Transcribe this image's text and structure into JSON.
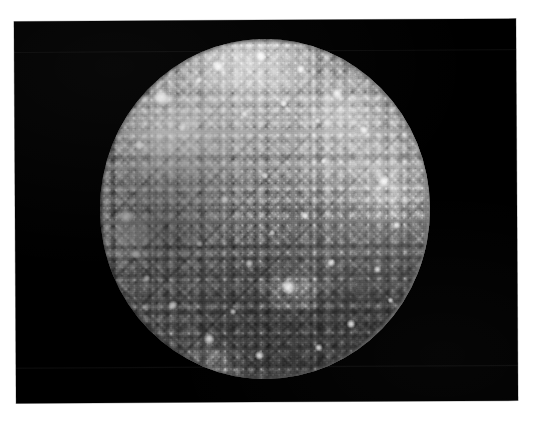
{
  "image": {
    "domain": "Natural-Image",
    "subject": "Callisto",
    "subject_type": "moon",
    "description": "Grayscale spacecraft photograph of a heavily cratered icy moon disk centered on a black sky background",
    "orientation": "landscape",
    "is_color": false,
    "alt_text": "A full disk of a heavily cratered grey moon against black space, densely covered with bright impact craters"
  },
  "frame": {
    "page_background_color": "#ffffff",
    "plate_background_color": "#000000",
    "plate_border_color": "#b8b8b8",
    "plate_rotation_degrees": -0.32,
    "plate_left": 15,
    "plate_top": 20,
    "plate_width": 502,
    "plate_height": 382
  },
  "disk": {
    "label": "moon-disk",
    "center_x": 250,
    "center_y": 189,
    "radius_x": 165,
    "radius_y": 170,
    "base_color": "#8e8e8e",
    "highlight_color": "#e8e8e8",
    "shadow_color": "#2a2a2a",
    "limb_bright_side": "east",
    "limb_dark_side": "west",
    "brightest_quadrant": "north-west",
    "darkest_quadrant": "south-east",
    "surface_texture": "dense overlapping impact craters with bright ejecta rays"
  },
  "bright_craters": [
    {
      "name": "crater-nw-large",
      "x": 19,
      "y": 17,
      "size": 17,
      "intensity": 0.95
    },
    {
      "name": "crater-n-1",
      "x": 36,
      "y": 8,
      "size": 12,
      "intensity": 0.92
    },
    {
      "name": "crater-n-2",
      "x": 49,
      "y": 5,
      "size": 10,
      "intensity": 0.9
    },
    {
      "name": "crater-n-3",
      "x": 61,
      "y": 9,
      "size": 9,
      "intensity": 0.88
    },
    {
      "name": "crater-ne-1",
      "x": 72,
      "y": 16,
      "size": 11,
      "intensity": 0.9
    },
    {
      "name": "crater-ne-2",
      "x": 80,
      "y": 27,
      "size": 9,
      "intensity": 0.86
    },
    {
      "name": "crater-nw-2",
      "x": 12,
      "y": 31,
      "size": 9,
      "intensity": 0.84
    },
    {
      "name": "crater-nw-3",
      "x": 25,
      "y": 26,
      "size": 8,
      "intensity": 0.82
    },
    {
      "name": "crater-c-1",
      "x": 44,
      "y": 22,
      "size": 8,
      "intensity": 0.84
    },
    {
      "name": "crater-c-2",
      "x": 56,
      "y": 19,
      "size": 7,
      "intensity": 0.8
    },
    {
      "name": "crater-e-1",
      "x": 86,
      "y": 42,
      "size": 12,
      "intensity": 0.94
    },
    {
      "name": "crater-e-2",
      "x": 90,
      "y": 55,
      "size": 8,
      "intensity": 0.82
    },
    {
      "name": "crater-w-1",
      "x": 8,
      "y": 52,
      "size": 13,
      "intensity": 0.9
    },
    {
      "name": "crater-w-2",
      "x": 11,
      "y": 63,
      "size": 9,
      "intensity": 0.84
    },
    {
      "name": "crater-c-3",
      "x": 38,
      "y": 47,
      "size": 8,
      "intensity": 0.82
    },
    {
      "name": "crater-c-4",
      "x": 50,
      "y": 40,
      "size": 7,
      "intensity": 0.8
    },
    {
      "name": "crater-c-5",
      "x": 62,
      "y": 52,
      "size": 8,
      "intensity": 0.82
    },
    {
      "name": "crater-c-6",
      "x": 30,
      "y": 60,
      "size": 7,
      "intensity": 0.78
    },
    {
      "name": "crater-s-1",
      "x": 57,
      "y": 73,
      "size": 14,
      "intensity": 0.96
    },
    {
      "name": "crater-s-2",
      "x": 45,
      "y": 66,
      "size": 8,
      "intensity": 0.8
    },
    {
      "name": "crater-s-3",
      "x": 70,
      "y": 66,
      "size": 8,
      "intensity": 0.8
    },
    {
      "name": "crater-sw-1",
      "x": 22,
      "y": 78,
      "size": 9,
      "intensity": 0.84
    },
    {
      "name": "crater-sw-2",
      "x": 33,
      "y": 88,
      "size": 11,
      "intensity": 0.88
    },
    {
      "name": "crater-s-4",
      "x": 48,
      "y": 93,
      "size": 9,
      "intensity": 0.84
    },
    {
      "name": "crater-se-1",
      "x": 76,
      "y": 84,
      "size": 9,
      "intensity": 0.84
    },
    {
      "name": "crater-se-2",
      "x": 66,
      "y": 91,
      "size": 8,
      "intensity": 0.8
    },
    {
      "name": "crater-se-3",
      "x": 84,
      "y": 68,
      "size": 8,
      "intensity": 0.8
    },
    {
      "name": "crater-sw-3",
      "x": 14,
      "y": 70,
      "size": 7,
      "intensity": 0.76
    },
    {
      "name": "crater-c-7",
      "x": 52,
      "y": 57,
      "size": 6,
      "intensity": 0.76
    },
    {
      "name": "crater-c-8",
      "x": 68,
      "y": 36,
      "size": 6,
      "intensity": 0.76
    },
    {
      "name": "crater-n-4",
      "x": 30,
      "y": 12,
      "size": 7,
      "intensity": 0.8
    },
    {
      "name": "crater-ne-3",
      "x": 66,
      "y": 24,
      "size": 6,
      "intensity": 0.74
    },
    {
      "name": "crater-s-5",
      "x": 40,
      "y": 80,
      "size": 7,
      "intensity": 0.78
    },
    {
      "name": "crater-se-4",
      "x": 88,
      "y": 77,
      "size": 6,
      "intensity": 0.74
    }
  ]
}
